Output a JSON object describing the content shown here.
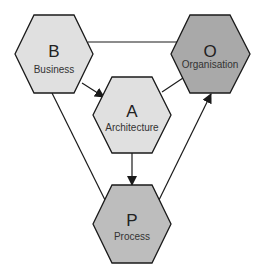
{
  "diagram": {
    "colors": {
      "light_fill": "#e0e0e0",
      "dark_fill": "#a8a8a8",
      "mid_fill": "#c0c0c0",
      "stroke": "#1a1a1a"
    },
    "nodes": [
      {
        "id": "B",
        "letter": "B",
        "label": "Business",
        "cx": 54,
        "cy": 54,
        "fill": "#e0e0e0"
      },
      {
        "id": "O",
        "letter": "O",
        "label": "Organisation",
        "cx": 210,
        "cy": 54,
        "fill": "#a9a9a9"
      },
      {
        "id": "A",
        "letter": "A",
        "label": "Architecture",
        "cx": 132,
        "cy": 115,
        "fill": "#e0e0e0"
      },
      {
        "id": "P",
        "letter": "P",
        "label": "Process",
        "cx": 132,
        "cy": 224,
        "fill": "#bdbdbd"
      }
    ],
    "edges": [
      {
        "from": "B",
        "to": "O",
        "arrow": false
      },
      {
        "from": "B",
        "to": "A",
        "arrow": true
      },
      {
        "from": "A",
        "to": "O",
        "arrow": false
      },
      {
        "from": "A",
        "to": "P",
        "arrow": true
      },
      {
        "from": "B",
        "to": "P",
        "arrow": false
      },
      {
        "from": "P",
        "to": "O",
        "arrow": true
      }
    ]
  }
}
